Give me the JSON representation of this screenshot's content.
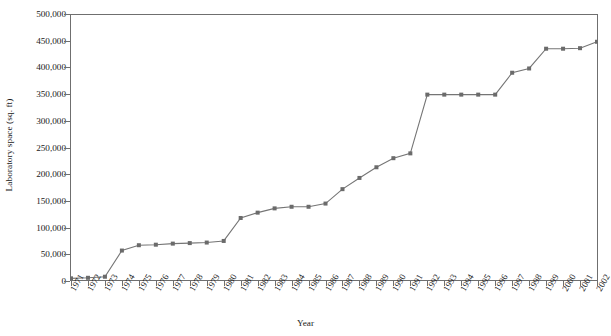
{
  "chart_data": {
    "type": "line",
    "title": "",
    "xlabel": "Year",
    "ylabel": "Laboratory space (sq. ft)",
    "grid": false,
    "legend": "none",
    "marker": "square",
    "line_color": "#757575",
    "marker_color": "#6b6b6b",
    "axis_color": "#6f6f6f",
    "xlim": [
      1971,
      2002
    ],
    "ylim": [
      0,
      500000
    ],
    "ytick_step": 50000,
    "ytick_labels": [
      "0",
      "50,000",
      "100,000",
      "150,000",
      "200,000",
      "250,000",
      "300,000",
      "350,000",
      "400,000",
      "450,000",
      "500,000"
    ],
    "ytick_values": [
      0,
      50000,
      100000,
      150000,
      200000,
      250000,
      300000,
      350000,
      400000,
      450000,
      500000
    ],
    "categories": [
      "1971",
      "1972",
      "1973",
      "1974",
      "1975",
      "1976",
      "1977",
      "1978",
      "1979",
      "1980",
      "1981",
      "1982",
      "1983",
      "1984",
      "1985",
      "1986",
      "1987",
      "1988",
      "1989",
      "1990",
      "1991",
      "1992",
      "1993",
      "1994",
      "1995",
      "1996",
      "1997",
      "1998",
      "1999",
      "2000",
      "2001",
      "2002"
    ],
    "values": [
      5000,
      6000,
      8000,
      57000,
      67000,
      68000,
      70000,
      71000,
      72000,
      75000,
      118000,
      128000,
      136000,
      139000,
      139000,
      145000,
      172000,
      193000,
      213000,
      230000,
      239000,
      349000,
      349000,
      349000,
      349000,
      349000,
      390000,
      398000,
      435000,
      435000,
      436000,
      448000
    ],
    "series": [
      {
        "name": "Laboratory space",
        "values": [
          5000,
          6000,
          8000,
          57000,
          67000,
          68000,
          70000,
          71000,
          72000,
          75000,
          118000,
          128000,
          136000,
          139000,
          139000,
          145000,
          172000,
          193000,
          213000,
          230000,
          239000,
          349000,
          349000,
          349000,
          349000,
          349000,
          390000,
          398000,
          435000,
          435000,
          436000,
          448000
        ]
      }
    ]
  }
}
